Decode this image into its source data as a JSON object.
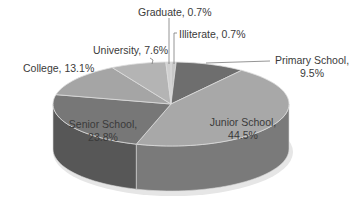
{
  "chart_data": {
    "type": "pie",
    "style": "3d-pie",
    "title": "",
    "legend": "none",
    "start_angle_deg": 0,
    "direction": "clockwise",
    "slices": [
      {
        "label": "Illiterate",
        "value": 0.7,
        "display": "Illiterate, 0.7%",
        "color": "#c8c8c8",
        "side": "#9a9a9a"
      },
      {
        "label": "Primary School",
        "value": 9.5,
        "display": "Primary School, 9.5%",
        "color": "#6e6e6e",
        "side": "#505050"
      },
      {
        "label": "Junior School",
        "value": 44.5,
        "display": "Junior School, 44.5%",
        "color": "#a8a8a8",
        "side": "#7a7a7a"
      },
      {
        "label": "Senior School",
        "value": 23.8,
        "display": "Senior School, 23.8%",
        "color": "#777777",
        "side": "#575757"
      },
      {
        "label": "College",
        "value": 13.1,
        "display": "College, 13.1%",
        "color": "#a5a5a5",
        "side": "#7d7d7d"
      },
      {
        "label": "University",
        "value": 7.6,
        "display": "University, 7.6%",
        "color": "#b4b4b4",
        "side": "#8a8a8a"
      },
      {
        "label": "Graduate",
        "value": 0.7,
        "display": "Graduate, 0.7%",
        "color": "#d0d0d0",
        "side": "#a0a0a0"
      }
    ],
    "categories": [
      "Illiterate",
      "Primary School",
      "Junior School",
      "Senior School",
      "College",
      "University",
      "Graduate"
    ],
    "values": [
      0.7,
      9.5,
      44.5,
      23.8,
      13.1,
      7.6,
      0.7
    ],
    "unit": "%"
  },
  "labels": {
    "graduate": "Graduate, 0.7%",
    "illiterate": "Illiterate, 0.7%",
    "university": "University, 7.6%",
    "college": "College, 13.1%",
    "primary_line1": "Primary School,",
    "primary_line2": "9.5%",
    "junior_line1": "Junior School,",
    "junior_line2": "44.5%",
    "senior_line1": "Senior School,",
    "senior_line2": "23.8%"
  }
}
